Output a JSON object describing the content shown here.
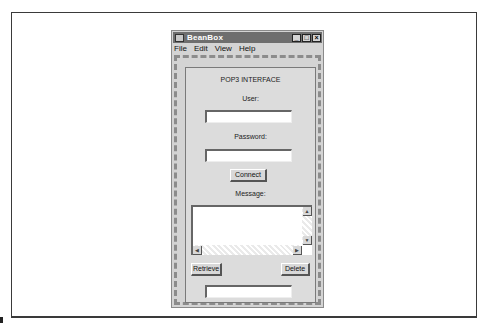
{
  "window": {
    "title": "BeanBox",
    "controls": {
      "minimize": "_",
      "maximize": "□",
      "close": "×"
    }
  },
  "menu": [
    "File",
    "Edit",
    "View",
    "Help"
  ],
  "bean": {
    "heading": "POP3 INTERFACE",
    "user_label": "User:",
    "user_value": "",
    "password_label": "Password:",
    "password_value": "",
    "connect_label": "Connect",
    "message_label": "Message:",
    "message_value": "",
    "retrieve_label": "Retrieve",
    "delete_label": "Delete",
    "status_value": ""
  },
  "icons": {
    "app": "beanbox-app-icon",
    "scroll_up": "▲",
    "scroll_down": "▼",
    "scroll_left": "◀",
    "scroll_right": "▶"
  }
}
